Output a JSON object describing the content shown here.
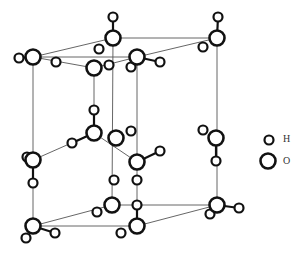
{
  "diagram": {
    "title": "",
    "type": "crystal-lattice",
    "legend": [
      {
        "symbol": "H",
        "label": "H",
        "size": "small"
      },
      {
        "symbol": "O",
        "label": "O",
        "size": "large"
      }
    ],
    "atoms": {
      "O": [
        [
          113,
          38
        ],
        [
          217,
          38
        ],
        [
          33,
          57
        ],
        [
          137,
          57
        ],
        [
          94,
          68
        ],
        [
          94,
          133
        ],
        [
          116,
          138
        ],
        [
          216,
          138
        ],
        [
          33,
          160
        ],
        [
          137,
          162
        ],
        [
          33,
          226
        ],
        [
          112,
          205
        ],
        [
          137,
          226
        ],
        [
          217,
          205
        ]
      ],
      "H": [
        [
          113,
          17
        ],
        [
          218,
          17
        ],
        [
          19,
          58
        ],
        [
          160,
          62
        ],
        [
          56,
          62
        ],
        [
          99,
          49
        ],
        [
          203,
          47
        ],
        [
          109,
          65
        ],
        [
          131,
          67
        ],
        [
          94,
          110
        ],
        [
          72,
          143
        ],
        [
          131,
          131
        ],
        [
          160,
          151
        ],
        [
          203,
          130
        ],
        [
          27,
          157
        ],
        [
          33,
          183
        ],
        [
          216,
          161
        ],
        [
          114,
          180
        ],
        [
          137,
          180
        ],
        [
          26,
          238
        ],
        [
          55,
          233
        ],
        [
          97,
          212
        ],
        [
          121,
          233
        ],
        [
          137,
          205
        ],
        [
          239,
          208
        ],
        [
          210,
          214
        ]
      ]
    }
  }
}
